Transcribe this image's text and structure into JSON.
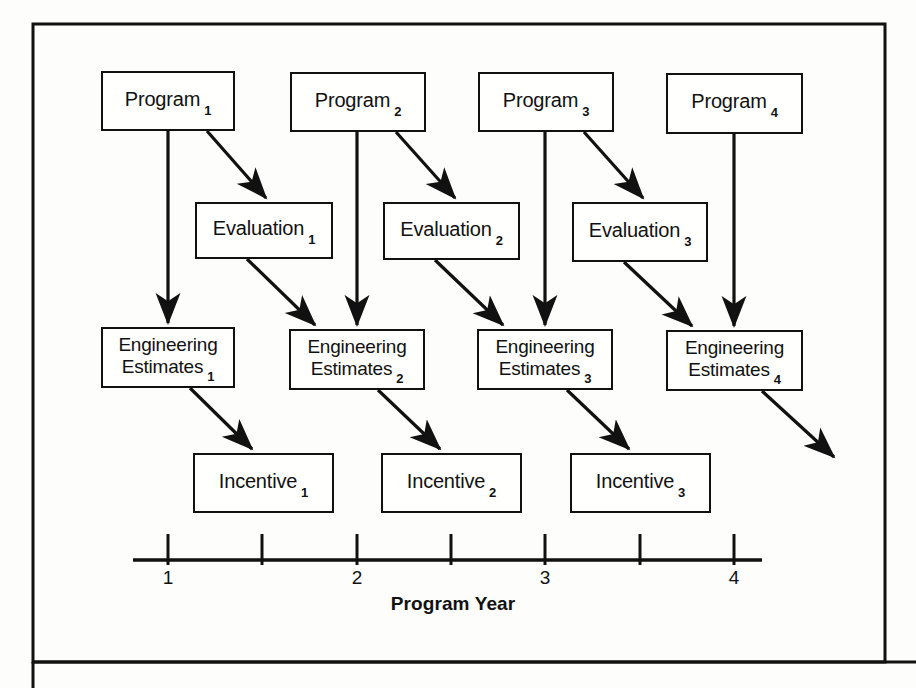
{
  "figure": {
    "kind": "timeline-flow-diagram",
    "frame": {
      "x": 33,
      "y": 24,
      "width": 852,
      "height": 638,
      "border_color": "#111111"
    },
    "divider_y": 662,
    "background": "#fdfdfb"
  },
  "nodes": [
    {
      "id": "program-1",
      "type": "program",
      "text": "Program",
      "subscript": "1",
      "x": 101,
      "y": 71,
      "w": 134,
      "h": 60,
      "lines": [
        "Program"
      ]
    },
    {
      "id": "program-2",
      "type": "program",
      "text": "Program",
      "subscript": "2",
      "x": 290,
      "y": 72,
      "w": 136,
      "h": 60,
      "lines": [
        "Program"
      ]
    },
    {
      "id": "program-3",
      "type": "program",
      "text": "Program",
      "subscript": "3",
      "x": 478,
      "y": 72,
      "w": 136,
      "h": 60,
      "lines": [
        "Program"
      ]
    },
    {
      "id": "program-4",
      "type": "program",
      "text": "Program",
      "subscript": "4",
      "x": 666,
      "y": 73,
      "w": 137,
      "h": 61,
      "lines": [
        "Program"
      ]
    },
    {
      "id": "evaluation-1",
      "type": "evaluation",
      "text": "Evaluation",
      "subscript": "1",
      "x": 195,
      "y": 202,
      "w": 138,
      "h": 57,
      "lines": [
        "Evaluation"
      ]
    },
    {
      "id": "evaluation-2",
      "type": "evaluation",
      "text": "Evaluation",
      "subscript": "2",
      "x": 383,
      "y": 202,
      "w": 137,
      "h": 58,
      "lines": [
        "Evaluation"
      ]
    },
    {
      "id": "evaluation-3",
      "type": "evaluation",
      "text": "Evaluation",
      "subscript": "3",
      "x": 572,
      "y": 202,
      "w": 136,
      "h": 60,
      "lines": [
        "Evaluation"
      ]
    },
    {
      "id": "engineering-estimates-1",
      "type": "engineering-estimates",
      "text": "Engineering Estimates",
      "subscript": "1",
      "x": 101,
      "y": 327,
      "w": 134,
      "h": 61,
      "lines": [
        "Engineering",
        "Estimates"
      ]
    },
    {
      "id": "engineering-estimates-2",
      "type": "engineering-estimates",
      "text": "Engineering Estimates",
      "subscript": "2",
      "x": 289,
      "y": 329,
      "w": 136,
      "h": 61,
      "lines": [
        "Engineering",
        "Estimates"
      ]
    },
    {
      "id": "engineering-estimates-3",
      "type": "engineering-estimates",
      "text": "Engineering Estimates",
      "subscript": "3",
      "x": 477,
      "y": 329,
      "w": 136,
      "h": 61,
      "lines": [
        "Engineering",
        "Estimates"
      ]
    },
    {
      "id": "engineering-estimates-4",
      "type": "engineering-estimates",
      "text": "Engineering Estimates",
      "subscript": "4",
      "x": 666,
      "y": 330,
      "w": 137,
      "h": 61,
      "lines": [
        "Engineering",
        "Estimates"
      ]
    },
    {
      "id": "incentive-1",
      "type": "incentive",
      "text": "Incentive",
      "subscript": "1",
      "x": 193,
      "y": 453,
      "w": 141,
      "h": 60,
      "lines": [
        "Incentive"
      ]
    },
    {
      "id": "incentive-2",
      "type": "incentive",
      "text": "Incentive",
      "subscript": "2",
      "x": 381,
      "y": 453,
      "w": 141,
      "h": 60,
      "lines": [
        "Incentive"
      ]
    },
    {
      "id": "incentive-3",
      "type": "incentive",
      "text": "Incentive",
      "subscript": "3",
      "x": 570,
      "y": 453,
      "w": 141,
      "h": 60,
      "lines": [
        "Incentive"
      ]
    }
  ],
  "edges": [
    {
      "id": "edge-program1-evaluation1",
      "from": "program-1",
      "to": "evaluation-1",
      "x1": 207,
      "y1": 131,
      "x2": 266,
      "y2": 198
    },
    {
      "id": "edge-program2-evaluation2",
      "from": "program-2",
      "to": "evaluation-2",
      "x1": 396,
      "y1": 132,
      "x2": 455,
      "y2": 198
    },
    {
      "id": "edge-program3-evaluation3",
      "from": "program-3",
      "to": "evaluation-3",
      "x1": 584,
      "y1": 132,
      "x2": 643,
      "y2": 198
    },
    {
      "id": "edge-program1-estimates1",
      "from": "program-1",
      "to": "engineering-estimates-1",
      "x1": 168,
      "y1": 131,
      "x2": 168,
      "y2": 323
    },
    {
      "id": "edge-program2-estimates2",
      "from": "program-2",
      "to": "engineering-estimates-2",
      "x1": 357,
      "y1": 132,
      "x2": 357,
      "y2": 325
    },
    {
      "id": "edge-program3-estimates3",
      "from": "program-3",
      "to": "engineering-estimates-3",
      "x1": 545,
      "y1": 132,
      "x2": 545,
      "y2": 325
    },
    {
      "id": "edge-program4-estimates4",
      "from": "program-4",
      "to": "engineering-estimates-4",
      "x1": 734,
      "y1": 134,
      "x2": 734,
      "y2": 326
    },
    {
      "id": "edge-evaluation1-estimates2",
      "from": "evaluation-1",
      "to": "engineering-estimates-2",
      "x1": 247,
      "y1": 259,
      "x2": 315,
      "y2": 325
    },
    {
      "id": "edge-evaluation2-estimates3",
      "from": "evaluation-2",
      "to": "engineering-estimates-3",
      "x1": 435,
      "y1": 260,
      "x2": 503,
      "y2": 325
    },
    {
      "id": "edge-evaluation3-estimates4",
      "from": "evaluation-3",
      "to": "engineering-estimates-4",
      "x1": 624,
      "y1": 262,
      "x2": 692,
      "y2": 326
    },
    {
      "id": "edge-estimates1-incentive1",
      "from": "engineering-estimates-1",
      "to": "incentive-1",
      "x1": 190,
      "y1": 388,
      "x2": 252,
      "y2": 449
    },
    {
      "id": "edge-estimates2-incentive2",
      "from": "engineering-estimates-2",
      "to": "incentive-2",
      "x1": 378,
      "y1": 390,
      "x2": 440,
      "y2": 449
    },
    {
      "id": "edge-estimates3-incentive3",
      "from": "engineering-estimates-3",
      "to": "incentive-3",
      "x1": 567,
      "y1": 390,
      "x2": 629,
      "y2": 449
    },
    {
      "id": "edge-estimates4-open",
      "from": "engineering-estimates-4",
      "to": null,
      "x1": 762,
      "y1": 391,
      "x2": 834,
      "y2": 457
    }
  ],
  "axis": {
    "id": "program-year-axis",
    "title": "Program Year",
    "title_x": 453,
    "title_y": 593,
    "line": {
      "x1": 133,
      "x2": 762,
      "y": 560
    },
    "tick_height": 26,
    "ticks": [
      {
        "x": 168,
        "label": "1",
        "major": true
      },
      {
        "x": 262,
        "label": "",
        "major": false
      },
      {
        "x": 357,
        "label": "2",
        "major": true
      },
      {
        "x": 451,
        "label": "",
        "major": false
      },
      {
        "x": 545,
        "label": "3",
        "major": true
      },
      {
        "x": 640,
        "label": "",
        "major": false
      },
      {
        "x": 734,
        "label": "4",
        "major": true
      }
    ],
    "tick_label_y": 567
  }
}
